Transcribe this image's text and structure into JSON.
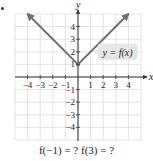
{
  "chart_data": {
    "type": "line",
    "title": "",
    "xlabel": "x",
    "ylabel": "y",
    "xlim": [
      -5,
      5
    ],
    "ylim": [
      -5,
      5
    ],
    "grid": true,
    "x_ticks": [
      -4,
      -3,
      -2,
      -1,
      1,
      2,
      3,
      4
    ],
    "x_tick_labels": [
      "−4",
      "−3",
      "−2",
      "−1",
      "1",
      "2",
      "3",
      "4"
    ],
    "y_ticks": [
      -4,
      -3,
      -2,
      -1,
      1,
      2,
      3,
      4
    ],
    "y_tick_labels": [
      "−4",
      "−3",
      "−2",
      "1",
      "2",
      "3",
      "4"
    ],
    "series": [
      {
        "name": "y = f(x)",
        "x": [
          -4,
          0,
          4
        ],
        "y": [
          5,
          1,
          5
        ],
        "arrows_at_ends": true,
        "vertex": [
          0,
          1
        ]
      }
    ],
    "annotations": [
      {
        "text": "y = f(x)",
        "x": 3.7,
        "y": 2,
        "style": "gray-callout"
      }
    ]
  },
  "labels": {
    "x_axis": "x",
    "y_axis": "y",
    "curve_label": "y = f(x)",
    "question": "f(−1) = ?   f(3) = ?"
  },
  "colors": {
    "curve": "#6e6e6e",
    "grid": "#dcdcdc",
    "axis": "#333333",
    "callout_bg": "#e6e6e6",
    "text": "#222222"
  }
}
